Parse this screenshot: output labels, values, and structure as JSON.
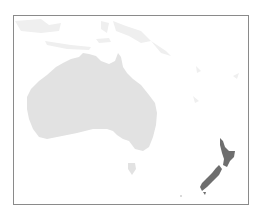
{
  "map": {
    "region": "Oceania",
    "highlighted_country": "New Zealand",
    "colors": {
      "background": "#ffffff",
      "land": "#e2e2e2",
      "highlight": "#6e6e6e",
      "frame": "#8a8a8a"
    }
  }
}
